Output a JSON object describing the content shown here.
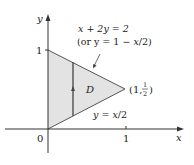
{
  "diagram": {
    "colors": {
      "region_fill": "#e3e3e3",
      "line": "#444444",
      "axis": "#333333",
      "text": "#222222"
    },
    "axes": {
      "x_label": "x",
      "y_label": "y",
      "origin_label": "0",
      "x_tick_label": "1",
      "y_tick_label": "1"
    },
    "region": {
      "label": "D",
      "vertices": [
        [
          0,
          0
        ],
        [
          0,
          1
        ],
        [
          1,
          0.5
        ]
      ]
    },
    "labels": {
      "upper_line_eq": "x + 2y = 2",
      "upper_line_alt_prefix": "(or y = 1 − ",
      "upper_line_alt_x": "x",
      "upper_line_alt_suffix": "/2)",
      "lower_line_eq_prefix": "y = ",
      "lower_line_eq_x": "x",
      "lower_line_eq_suffix": "/2",
      "vertex_label_prefix": "(1, ",
      "vertex_label_num": "1",
      "vertex_label_den": "2",
      "vertex_label_suffix": ")"
    }
  }
}
